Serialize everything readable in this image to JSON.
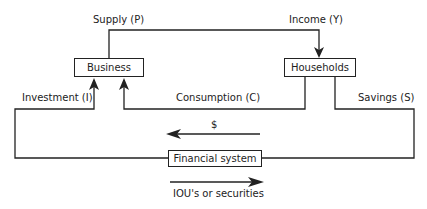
{
  "nodes": {
    "business": "Business",
    "households": "Households",
    "financial_system": "Financial system"
  },
  "flows": {
    "supply": "Supply (P)",
    "income": "Income (Y)",
    "investment": "Investment (I)",
    "consumption": "Consumption (C)",
    "savings": "Savings (S)",
    "money": "$",
    "securities": "IOU's or securities"
  },
  "colors": {
    "line": "#222222",
    "background": "#ffffff"
  }
}
